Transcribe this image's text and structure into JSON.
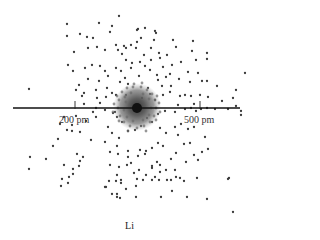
{
  "figure": {
    "title": "Li",
    "axis": {
      "y": 108,
      "x_start": 13,
      "x_end": 240,
      "ticks": [
        {
          "x": 75,
          "label": "200 pm"
        },
        {
          "x": 200,
          "label": "500 pm"
        }
      ]
    },
    "nucleus": {
      "x": 137,
      "y": 108,
      "r": 5,
      "color": "#111111"
    },
    "core_cloud": {
      "x": 137,
      "y": 107,
      "r": 24,
      "color": "#555555"
    },
    "dot_color": "#3a3a3a",
    "dots": [
      [
        119,
        16
      ],
      [
        67,
        24
      ],
      [
        99,
        23
      ],
      [
        112,
        26
      ],
      [
        80,
        34
      ],
      [
        67,
        36
      ],
      [
        110,
        32
      ],
      [
        138,
        29
      ],
      [
        145,
        28
      ],
      [
        155,
        31
      ],
      [
        137,
        30
      ],
      [
        87,
        37
      ],
      [
        93,
        38
      ],
      [
        116,
        45
      ],
      [
        124,
        46
      ],
      [
        137,
        42
      ],
      [
        141,
        38
      ],
      [
        131,
        45
      ],
      [
        126,
        48
      ],
      [
        173,
        40
      ],
      [
        193,
        41
      ],
      [
        176,
        47
      ],
      [
        74,
        52
      ],
      [
        88,
        48
      ],
      [
        97,
        47
      ],
      [
        105,
        50
      ],
      [
        118,
        50
      ],
      [
        122,
        54
      ],
      [
        136,
        48
      ],
      [
        151,
        48
      ],
      [
        144,
        55
      ],
      [
        159,
        53
      ],
      [
        167,
        55
      ],
      [
        192,
        51
      ],
      [
        207,
        53
      ],
      [
        207,
        59
      ],
      [
        196,
        60
      ],
      [
        181,
        62
      ],
      [
        160,
        58
      ],
      [
        151,
        60
      ],
      [
        140,
        62
      ],
      [
        132,
        63
      ],
      [
        126,
        60
      ],
      [
        68,
        65
      ],
      [
        73,
        71
      ],
      [
        85,
        68
      ],
      [
        92,
        65
      ],
      [
        100,
        66
      ],
      [
        105,
        71
      ],
      [
        116,
        68
      ],
      [
        121,
        71
      ],
      [
        131,
        68
      ],
      [
        145,
        66
      ],
      [
        150,
        70
      ],
      [
        163,
        67
      ],
      [
        172,
        65
      ],
      [
        188,
        72
      ],
      [
        198,
        73
      ],
      [
        245,
        73
      ],
      [
        29,
        89
      ],
      [
        79,
        85
      ],
      [
        76,
        90
      ],
      [
        84,
        93
      ],
      [
        96,
        90
      ],
      [
        107,
        88
      ],
      [
        112,
        93
      ],
      [
        120,
        82
      ],
      [
        125,
        78
      ],
      [
        158,
        80
      ],
      [
        166,
        77
      ],
      [
        179,
        79
      ],
      [
        190,
        82
      ],
      [
        202,
        81
      ],
      [
        207,
        81
      ],
      [
        217,
        86
      ],
      [
        236,
        90
      ],
      [
        82,
        96
      ],
      [
        97,
        98
      ],
      [
        106,
        97
      ],
      [
        116,
        95
      ],
      [
        163,
        95
      ],
      [
        170,
        92
      ],
      [
        180,
        96
      ],
      [
        185,
        95
      ],
      [
        191,
        96
      ],
      [
        200,
        95
      ],
      [
        208,
        97
      ],
      [
        222,
        101
      ],
      [
        233,
        98
      ],
      [
        236,
        106
      ],
      [
        241,
        111
      ],
      [
        241,
        115
      ],
      [
        228,
        109
      ],
      [
        215,
        109
      ],
      [
        207,
        108
      ],
      [
        191,
        108
      ],
      [
        194,
        104
      ],
      [
        175,
        112
      ],
      [
        165,
        111
      ],
      [
        158,
        114
      ],
      [
        84,
        104
      ],
      [
        96,
        108
      ],
      [
        100,
        103
      ],
      [
        105,
        110
      ],
      [
        113,
        113
      ],
      [
        117,
        117
      ],
      [
        122,
        122
      ],
      [
        96,
        117
      ],
      [
        86,
        121
      ],
      [
        72,
        125
      ],
      [
        60,
        124
      ],
      [
        67,
        130
      ],
      [
        72,
        131
      ],
      [
        80,
        132
      ],
      [
        91,
        140
      ],
      [
        108,
        127
      ],
      [
        112,
        133
      ],
      [
        119,
        138
      ],
      [
        128,
        131
      ],
      [
        135,
        130
      ],
      [
        141,
        126
      ],
      [
        152,
        122
      ],
      [
        160,
        128
      ],
      [
        166,
        133
      ],
      [
        175,
        127
      ],
      [
        181,
        124
      ],
      [
        188,
        129
      ],
      [
        194,
        127
      ],
      [
        205,
        137
      ],
      [
        190,
        143
      ],
      [
        184,
        144
      ],
      [
        176,
        153
      ],
      [
        53,
        146
      ],
      [
        105,
        142
      ],
      [
        117,
        146
      ],
      [
        128,
        151
      ],
      [
        140,
        150
      ],
      [
        146,
        151
      ],
      [
        152,
        148
      ],
      [
        158,
        143
      ],
      [
        163,
        146
      ],
      [
        178,
        135
      ],
      [
        194,
        155
      ],
      [
        202,
        152
      ],
      [
        208,
        149
      ],
      [
        30,
        157
      ],
      [
        77,
        154
      ],
      [
        83,
        157
      ],
      [
        80,
        161
      ],
      [
        110,
        152
      ],
      [
        118,
        154
      ],
      [
        128,
        157
      ],
      [
        138,
        156
      ],
      [
        145,
        154
      ],
      [
        157,
        162
      ],
      [
        171,
        159
      ],
      [
        186,
        162
      ],
      [
        29,
        169
      ],
      [
        64,
        165
      ],
      [
        73,
        169
      ],
      [
        79,
        166
      ],
      [
        110,
        165
      ],
      [
        119,
        167
      ],
      [
        127,
        165
      ],
      [
        131,
        163
      ],
      [
        139,
        170
      ],
      [
        152,
        166
      ],
      [
        160,
        165
      ],
      [
        166,
        170
      ],
      [
        175,
        170
      ],
      [
        198,
        160
      ],
      [
        62,
        179
      ],
      [
        69,
        177
      ],
      [
        73,
        174
      ],
      [
        117,
        175
      ],
      [
        121,
        180
      ],
      [
        134,
        173
      ],
      [
        146,
        175
      ],
      [
        152,
        168
      ],
      [
        155,
        177
      ],
      [
        160,
        172
      ],
      [
        167,
        180
      ],
      [
        180,
        178
      ],
      [
        197,
        178
      ],
      [
        228,
        179
      ],
      [
        61,
        186
      ],
      [
        68,
        183
      ],
      [
        109,
        181
      ],
      [
        116,
        181
      ],
      [
        137,
        179
      ],
      [
        143,
        180
      ],
      [
        152,
        180
      ],
      [
        171,
        180
      ],
      [
        176,
        177
      ],
      [
        184,
        181
      ],
      [
        105,
        187
      ],
      [
        121,
        183
      ],
      [
        136,
        186
      ],
      [
        159,
        180
      ],
      [
        117,
        197
      ],
      [
        106,
        187
      ],
      [
        126,
        189
      ],
      [
        172,
        191
      ],
      [
        117,
        194
      ],
      [
        120,
        198
      ],
      [
        136,
        197
      ],
      [
        161,
        197
      ],
      [
        187,
        197
      ],
      [
        207,
        199
      ],
      [
        233,
        212
      ],
      [
        112,
        194
      ],
      [
        229,
        178
      ],
      [
        46,
        159
      ],
      [
        58,
        139
      ],
      [
        76,
        116
      ],
      [
        64,
        117
      ],
      [
        115,
        112
      ],
      [
        142,
        98
      ],
      [
        150,
        94
      ],
      [
        155,
        100
      ],
      [
        147,
        118
      ],
      [
        126,
        95
      ],
      [
        93,
        112
      ],
      [
        148,
        88
      ],
      [
        162,
        86
      ],
      [
        171,
        86
      ],
      [
        157,
        75
      ],
      [
        139,
        76
      ],
      [
        108,
        76
      ],
      [
        99,
        81
      ],
      [
        88,
        79
      ],
      [
        128,
        84
      ],
      [
        154,
        40
      ],
      [
        156,
        33
      ],
      [
        170,
        74
      ],
      [
        185,
        109
      ],
      [
        196,
        111
      ],
      [
        178,
        105
      ],
      [
        201,
        109
      ]
    ],
    "cloud_dots": [
      [
        122,
        92
      ],
      [
        127,
        88
      ],
      [
        133,
        87
      ],
      [
        141,
        87
      ],
      [
        147,
        90
      ],
      [
        152,
        94
      ],
      [
        155,
        100
      ],
      [
        156,
        108
      ],
      [
        154,
        116
      ],
      [
        150,
        122
      ],
      [
        144,
        126
      ],
      [
        137,
        128
      ],
      [
        130,
        126
      ],
      [
        124,
        122
      ],
      [
        120,
        116
      ],
      [
        118,
        108
      ],
      [
        119,
        100
      ],
      [
        125,
        97
      ],
      [
        131,
        93
      ],
      [
        143,
        94
      ],
      [
        149,
        99
      ],
      [
        151,
        108
      ],
      [
        149,
        115
      ],
      [
        143,
        120
      ],
      [
        133,
        121
      ],
      [
        127,
        117
      ],
      [
        124,
        110
      ],
      [
        126,
        102
      ],
      [
        114,
        104
      ],
      [
        113,
        112
      ],
      [
        159,
        103
      ],
      [
        160,
        112
      ],
      [
        128,
        131
      ],
      [
        146,
        131
      ],
      [
        134,
        84
      ],
      [
        142,
        83
      ],
      [
        117,
        96
      ],
      [
        157,
        96
      ],
      [
        119,
        121
      ],
      [
        156,
        120
      ]
    ]
  }
}
